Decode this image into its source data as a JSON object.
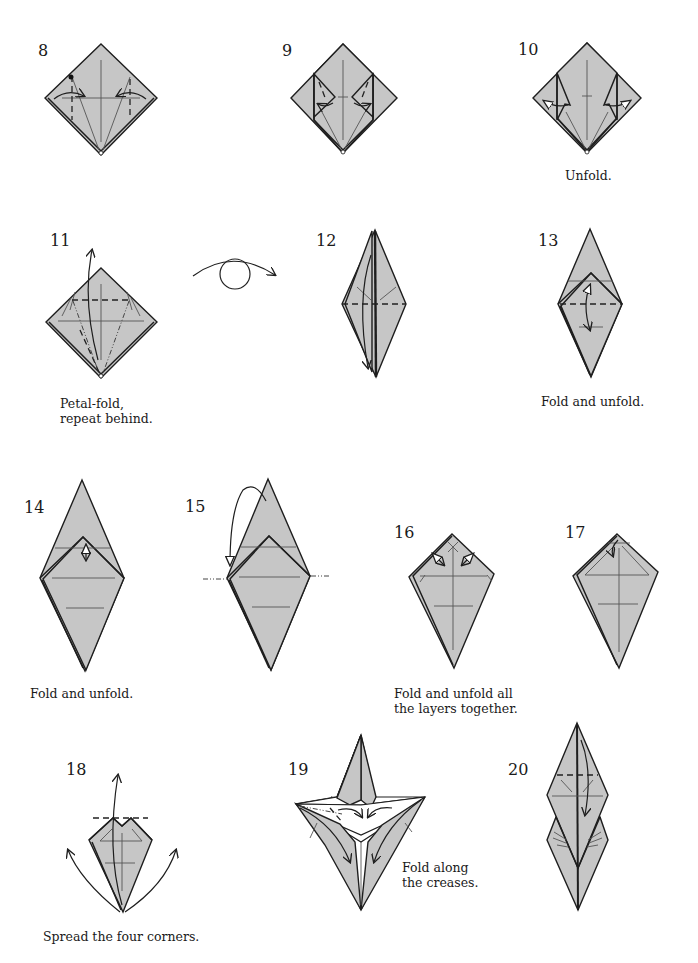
{
  "diagram": {
    "type": "origami folding instructions",
    "colors": {
      "paper": "#c6c6c6",
      "line": "#1e1e1e",
      "crease": "#555555",
      "background": "#ffffff"
    },
    "steps": [
      {
        "number": "8",
        "caption": ""
      },
      {
        "number": "9",
        "caption": ""
      },
      {
        "number": "10",
        "caption": "Unfold."
      },
      {
        "number": "11",
        "caption_lines": [
          "Petal-fold,",
          "repeat behind."
        ]
      },
      {
        "number": "12",
        "caption": ""
      },
      {
        "number": "13",
        "caption": "Fold and unfold."
      },
      {
        "number": "14",
        "caption": "Fold and unfold."
      },
      {
        "number": "15",
        "caption": ""
      },
      {
        "number": "16",
        "caption_lines": [
          "Fold and unfold all",
          "the layers together."
        ]
      },
      {
        "number": "17",
        "caption": ""
      },
      {
        "number": "18",
        "caption": "Spread the four corners."
      },
      {
        "number": "19",
        "caption_lines": [
          "Fold along",
          "the creases."
        ]
      },
      {
        "number": "20",
        "caption": ""
      }
    ],
    "symbols": {
      "turn_over": "turn-over-icon"
    }
  }
}
